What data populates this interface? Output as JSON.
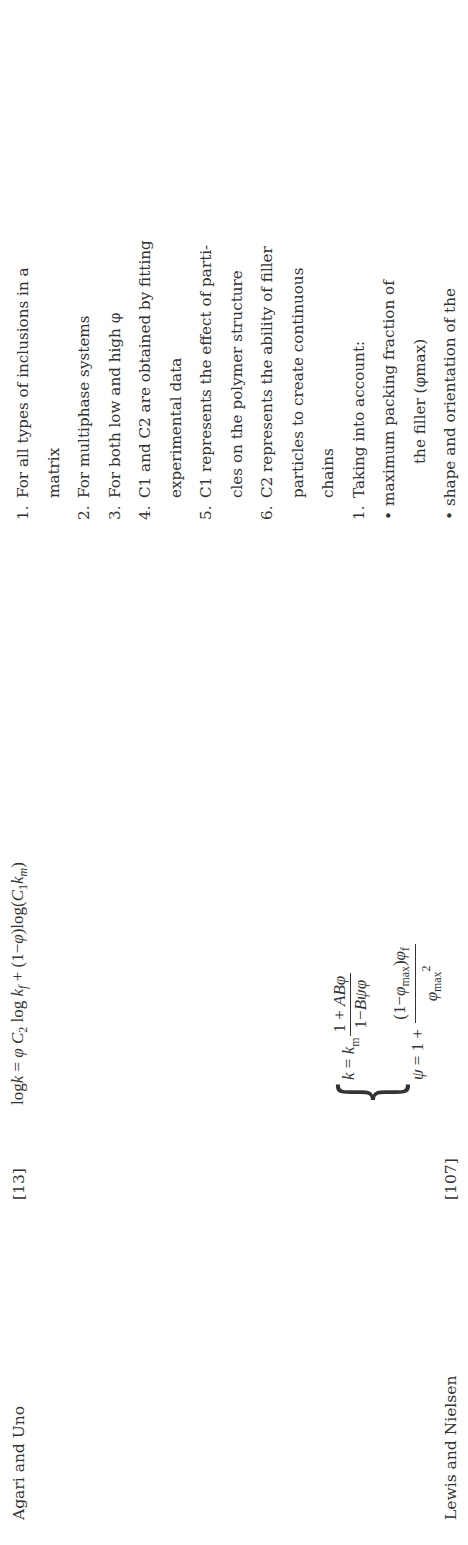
{
  "table": {
    "rows": [
      {
        "model": "Agari and Uno",
        "reference": "[13]",
        "equation": {
          "lhs": "logk",
          "text": "log k = φ C2 log kf + (1−φ) log(C1 km)"
        },
        "remarks": [
          {
            "num": "1.",
            "lines": [
              "For all types of inclusions in a",
              "matrix"
            ]
          },
          {
            "num": "2.",
            "lines": [
              "For multiphase systems"
            ]
          },
          {
            "num": "3.",
            "lines": [
              "For both low and high φ"
            ]
          },
          {
            "num": "4.",
            "lines": [
              "C1 and C2 are obtained by fitting",
              "experimental data"
            ]
          },
          {
            "num": "5.",
            "lines": [
              "C1 represents the effect of parti-",
              "cles on the polymer structure"
            ]
          },
          {
            "num": "6.",
            "lines": [
              "C2 represents the ability of filler",
              "particles to create continuous",
              "chains"
            ]
          }
        ]
      },
      {
        "model": "Lewis and Nielsen",
        "reference": "[107]",
        "equation": {
          "line1": "k = km (1 + ABφ)/(1 − Bψφ)",
          "line2": "ψ = 1 + ((1 − φmax) φf)/φmax²"
        },
        "remarks": {
          "num": "1.",
          "intro": "Taking into account:",
          "bullets": [
            [
              "maximum packing fraction of",
              "the filler (φmax)"
            ],
            [
              "shape and orientation of the"
            ]
          ]
        }
      }
    ]
  }
}
